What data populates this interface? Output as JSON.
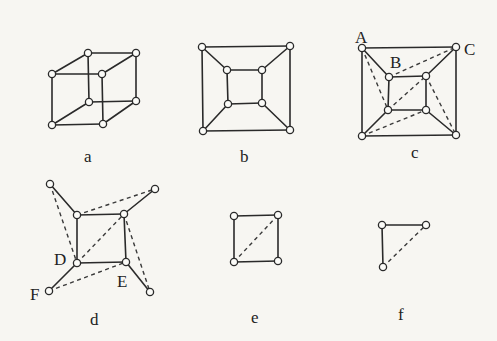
{
  "figure": {
    "panels": [
      {
        "id": "a",
        "caption": "a",
        "description": "cube graph drawn in perspective",
        "nodes": [
          [
            52,
            74
          ],
          [
            88,
            53
          ],
          [
            136,
            53
          ],
          [
            102,
            74
          ],
          [
            52,
            125
          ],
          [
            89,
            102
          ],
          [
            136,
            101
          ],
          [
            103,
            124
          ]
        ],
        "solid_edges": [
          [
            0,
            1
          ],
          [
            1,
            2
          ],
          [
            2,
            3
          ],
          [
            3,
            0
          ],
          [
            4,
            5
          ],
          [
            5,
            6
          ],
          [
            6,
            7
          ],
          [
            7,
            4
          ],
          [
            0,
            4
          ],
          [
            1,
            5
          ],
          [
            2,
            6
          ],
          [
            3,
            7
          ]
        ],
        "dashed_edges": [],
        "labels": []
      },
      {
        "id": "b",
        "caption": "b",
        "description": "planar drawing of cube graph",
        "nodes": [
          [
            202,
            47
          ],
          [
            290,
            46
          ],
          [
            290,
            130
          ],
          [
            203,
            131
          ],
          [
            227,
            70
          ],
          [
            262,
            70
          ],
          [
            262,
            103
          ],
          [
            228,
            104
          ]
        ],
        "solid_edges": [
          [
            0,
            1
          ],
          [
            1,
            2
          ],
          [
            2,
            3
          ],
          [
            3,
            0
          ],
          [
            4,
            5
          ],
          [
            5,
            6
          ],
          [
            6,
            7
          ],
          [
            7,
            4
          ],
          [
            0,
            4
          ],
          [
            1,
            5
          ],
          [
            2,
            6
          ],
          [
            3,
            7
          ]
        ],
        "dashed_edges": [],
        "labels": []
      },
      {
        "id": "c",
        "caption": "c",
        "description": "planar cube with dashed diagonals",
        "nodes": [
          [
            362,
            48
          ],
          [
            456,
            47
          ],
          [
            456,
            135
          ],
          [
            362,
            136
          ],
          [
            389,
            77
          ],
          [
            426,
            76
          ],
          [
            426,
            110
          ],
          [
            388,
            110
          ]
        ],
        "solid_edges": [
          [
            0,
            1
          ],
          [
            1,
            2
          ],
          [
            2,
            3
          ],
          [
            3,
            0
          ],
          [
            4,
            5
          ],
          [
            5,
            6
          ],
          [
            6,
            7
          ],
          [
            7,
            4
          ],
          [
            0,
            4
          ],
          [
            1,
            5
          ],
          [
            2,
            6
          ],
          [
            3,
            7
          ]
        ],
        "dashed_edges": [
          [
            0,
            7
          ],
          [
            4,
            1
          ],
          [
            7,
            5
          ],
          [
            3,
            6
          ],
          [
            5,
            2
          ]
        ],
        "labels": [
          {
            "text": "A",
            "x": 355,
            "y": 43
          },
          {
            "text": "B",
            "x": 390,
            "y": 68
          },
          {
            "text": "C",
            "x": 464,
            "y": 55
          }
        ]
      },
      {
        "id": "d",
        "caption": "d",
        "description": "square with four pendant vertices and dashed edges",
        "nodes": [
          [
            50,
            184
          ],
          [
            155,
            189
          ],
          [
            150,
            292
          ],
          [
            49,
            291
          ],
          [
            77,
            215
          ],
          [
            124,
            214
          ],
          [
            126,
            262
          ],
          [
            77,
            263
          ]
        ],
        "solid_edges": [
          [
            4,
            5
          ],
          [
            5,
            6
          ],
          [
            6,
            7
          ],
          [
            7,
            4
          ],
          [
            0,
            4
          ],
          [
            1,
            5
          ],
          [
            2,
            6
          ],
          [
            3,
            7
          ]
        ],
        "dashed_edges": [
          [
            0,
            7
          ],
          [
            4,
            1
          ],
          [
            7,
            5
          ],
          [
            5,
            2
          ],
          [
            3,
            6
          ]
        ],
        "labels": [
          {
            "text": "D",
            "x": 54,
            "y": 265
          },
          {
            "text": "E",
            "x": 117,
            "y": 287
          },
          {
            "text": "F",
            "x": 30,
            "y": 300
          }
        ]
      },
      {
        "id": "e",
        "caption": "e",
        "description": "square with one dashed diagonal",
        "nodes": [
          [
            234,
            216
          ],
          [
            278,
            215
          ],
          [
            278,
            261
          ],
          [
            234,
            262
          ]
        ],
        "solid_edges": [
          [
            0,
            1
          ],
          [
            1,
            2
          ],
          [
            2,
            3
          ],
          [
            3,
            0
          ]
        ],
        "dashed_edges": [
          [
            3,
            1
          ]
        ],
        "labels": []
      },
      {
        "id": "f",
        "caption": "f",
        "description": "path of two edges with dashed closing edge",
        "nodes": [
          [
            382,
            225
          ],
          [
            426,
            225
          ],
          [
            383,
            267
          ]
        ],
        "solid_edges": [
          [
            0,
            1
          ],
          [
            0,
            2
          ]
        ],
        "dashed_edges": [
          [
            2,
            1
          ]
        ],
        "labels": []
      }
    ],
    "captions_pos": {
      "a": [
        84,
        162
      ],
      "b": [
        240,
        162
      ],
      "c": [
        411,
        158
      ],
      "d": [
        90,
        325
      ],
      "e": [
        251,
        323
      ],
      "f": [
        398,
        320
      ]
    },
    "colors": {
      "background": "#f7f6f2",
      "stroke": "#2a2a2a",
      "node_fill": "#fbfbf8"
    }
  }
}
